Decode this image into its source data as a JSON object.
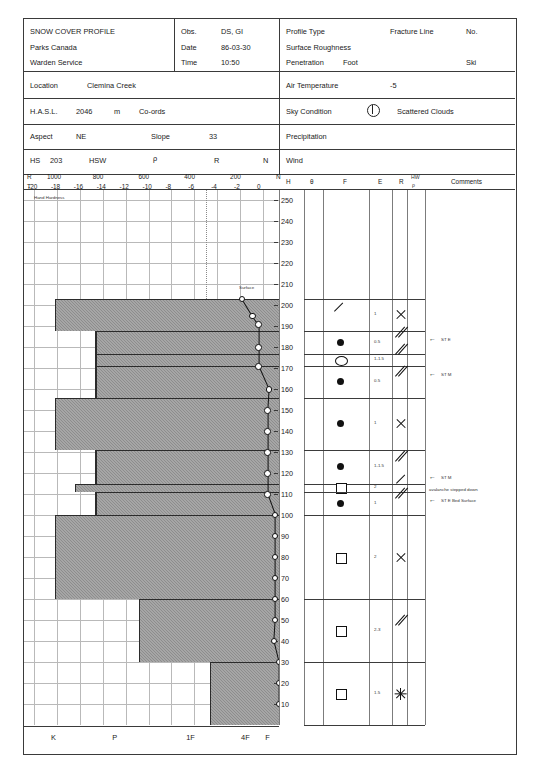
{
  "header": {
    "title_line1": "SNOW COVER PROFILE",
    "title_line2": "Parks Canada",
    "title_line3": "Warden Service",
    "obs_label": "Obs.",
    "obs_value": "DS, GI",
    "date_label": "Date",
    "date_value": "86-03-30",
    "time_label": "Time",
    "time_value": "10:50",
    "profile_type_label": "Profile Type",
    "profile_type_value": "Fracture Line",
    "no_label": "No.",
    "surface_roughness_label": "Surface Roughness",
    "penetration_label": "Penetration",
    "penetration_value": "Foot",
    "ski_label": "Ski",
    "location_label": "Location",
    "location_value": "Clemina Creek",
    "air_temp_label": "Air Temperature",
    "air_temp_value": "-5",
    "hasl_label": "H.A.S.L.",
    "hasl_value": "2046",
    "hasl_unit": "m",
    "coords_label": "Co-ords",
    "sky_label": "Sky Condition",
    "sky_icon": "half-sun-icon",
    "sky_value": "Scattered Clouds",
    "aspect_label": "Aspect",
    "aspect_value": "NE",
    "slope_label": "Slope",
    "slope_value": "33",
    "precip_label": "Precipitation",
    "hs_label": "HS",
    "hs_value": "203",
    "hsw_label": "HSW",
    "hsw_rho": "ρ",
    "hsw_r": "R",
    "hsw_n": "N",
    "wind_label": "Wind"
  },
  "axes": {
    "r_row_label": "R",
    "t_row_label": "T",
    "r_ticks": [
      "1000",
      "800",
      "600",
      "400",
      "200",
      "N"
    ],
    "t_ticks": [
      "-20",
      "-18",
      "-16",
      "-14",
      "-12",
      "-10",
      "-8",
      "-6",
      "-4",
      "-2",
      "0"
    ],
    "plot_caption": "Hand Hardness",
    "hardness_scale": [
      "K",
      "P",
      "1F",
      "4F",
      "F"
    ],
    "height_ticks": [
      250,
      240,
      230,
      220,
      210,
      200,
      190,
      180,
      170,
      160,
      150,
      140,
      130,
      120,
      110,
      100,
      90,
      80,
      70,
      60,
      50,
      40,
      30,
      20,
      10
    ],
    "surface_annotation": "Surface"
  },
  "table_columns": {
    "h": "H",
    "theta": "θ",
    "f": "F",
    "e": "E",
    "r": "R",
    "hw_rho_1": "HW",
    "hw_rho_2": "ρ",
    "comments": "Comments"
  },
  "chart_data": {
    "type": "bar",
    "xlabel": "Hand Hardness",
    "ylabel": "H (cm)",
    "ylim": [
      0,
      255
    ],
    "xlim_hardness": [
      "K",
      "P",
      "1F",
      "4F",
      "F"
    ],
    "grid": true,
    "total_snow_depth": 203,
    "temperature_trace_c": -5,
    "layers": [
      {
        "top": 203,
        "bottom": 188,
        "hardness": "F",
        "hardness_x": 0.88,
        "grain": "slash",
        "grain_name": "precipitation-particles",
        "e": "1",
        "r": "x",
        "comment": ""
      },
      {
        "top": 188,
        "bottom": 177,
        "hardness": "4F-F",
        "hardness_x": 0.72,
        "grain": "dot",
        "grain_name": "rounded-grains",
        "e": "0.5",
        "r": "double-slash",
        "comment": "ST E"
      },
      {
        "top": 177,
        "bottom": 171,
        "hardness": "4F",
        "hardness_x": 0.72,
        "grain": "ring",
        "grain_name": "open-ring-grain",
        "e": "1-1.5",
        "r": "double-slash",
        "comment": ""
      },
      {
        "top": 171,
        "bottom": 156,
        "hardness": "4F",
        "hardness_x": 0.72,
        "grain": "dot",
        "grain_name": "rounded-grains",
        "e": "0.5",
        "r": "double-slash",
        "comment": "ST M"
      },
      {
        "top": 156,
        "bottom": 131,
        "hardness": "F",
        "hardness_x": 0.88,
        "grain": "dot",
        "grain_name": "rounded-grains",
        "e": "1",
        "r": "x",
        "comment": ""
      },
      {
        "top": 131,
        "bottom": 115,
        "hardness": "4F",
        "hardness_x": 0.72,
        "grain": "dot",
        "grain_name": "rounded-grains",
        "e": "1-1.5",
        "r": "double-slash",
        "comment": "ST M"
      },
      {
        "top": 115,
        "bottom": 111,
        "hardness": "4F-F",
        "hardness_x": 0.8,
        "grain": "square",
        "grain_name": "faceted-crystals",
        "e": "2",
        "r": "single-slash",
        "comment": "avalanche stepped down"
      },
      {
        "top": 111,
        "bottom": 100,
        "hardness": "4F",
        "hardness_x": 0.72,
        "grain": "dot",
        "grain_name": "rounded-grains",
        "e": "1",
        "r": "double-slash",
        "comment": "ST E Bed Surface"
      },
      {
        "top": 100,
        "bottom": 60,
        "hardness": "F",
        "hardness_x": 0.88,
        "grain": "square",
        "grain_name": "faceted-crystals",
        "e": "2",
        "r": "x",
        "comment": ""
      },
      {
        "top": 60,
        "bottom": 30,
        "hardness": "1F",
        "hardness_x": 0.55,
        "grain": "square",
        "grain_name": "faceted-crystals",
        "e": "2-3",
        "r": "double-slash",
        "comment": ""
      },
      {
        "top": 30,
        "bottom": 0,
        "hardness": "P",
        "hardness_x": 0.27,
        "grain": "square",
        "grain_name": "depth-hoar",
        "e": "1.5",
        "r": "star",
        "comment": ""
      }
    ],
    "ram_profile_points": [
      {
        "h": 203,
        "x": 0.855
      },
      {
        "h": 195,
        "x": 0.895
      },
      {
        "h": 191,
        "x": 0.92
      },
      {
        "h": 180,
        "x": 0.92
      },
      {
        "h": 171,
        "x": 0.92
      },
      {
        "h": 160,
        "x": 0.96
      },
      {
        "h": 150,
        "x": 0.955
      },
      {
        "h": 140,
        "x": 0.955
      },
      {
        "h": 130,
        "x": 0.955
      },
      {
        "h": 120,
        "x": 0.955
      },
      {
        "h": 110,
        "x": 0.955
      },
      {
        "h": 100,
        "x": 0.985
      },
      {
        "h": 90,
        "x": 0.985
      },
      {
        "h": 80,
        "x": 0.985
      },
      {
        "h": 70,
        "x": 0.985
      },
      {
        "h": 60,
        "x": 0.985
      },
      {
        "h": 50,
        "x": 0.985
      },
      {
        "h": 40,
        "x": 0.98
      },
      {
        "h": 30,
        "x": 1.0
      },
      {
        "h": 20,
        "x": 1.0
      },
      {
        "h": 10,
        "x": 1.0
      }
    ]
  },
  "comments_list": [
    {
      "text": "ST E",
      "h": 188
    },
    {
      "text": "ST M",
      "h": 171
    },
    {
      "text": "ST M",
      "h": 122
    },
    {
      "text": "avalanche stepped down",
      "h": 115
    },
    {
      "text": "ST E Bed Surface",
      "h": 111
    }
  ]
}
